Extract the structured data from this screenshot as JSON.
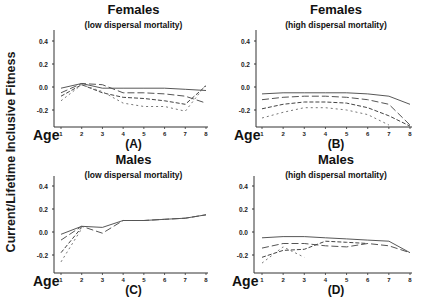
{
  "figure": {
    "ylabel": "Current/Lifetime Inclusive Fitness",
    "xlabel": "Age"
  },
  "chart_data": [
    {
      "type": "line",
      "panel": "(A)",
      "title": "Females",
      "subtitle": "(low dispersal mortality)",
      "xlabel": "Age",
      "ylabel": "Current/Lifetime Inclusive Fitness",
      "x": [
        1,
        2,
        3,
        4,
        5,
        6,
        7,
        8
      ],
      "yticks": [
        "0.4",
        "0.2",
        "0.0",
        "-0.2"
      ],
      "ylim": [
        -0.32,
        0.5
      ],
      "series": [
        {
          "name": "solid",
          "dash": "",
          "values": [
            -0.01,
            0.03,
            -0.01,
            -0.01,
            -0.01,
            -0.01,
            -0.02,
            -0.03
          ]
        },
        {
          "name": "long-dash",
          "dash": "7,3",
          "values": [
            -0.05,
            0.03,
            0.02,
            -0.05,
            -0.05,
            -0.06,
            -0.08,
            -0.14
          ]
        },
        {
          "name": "medium-dash",
          "dash": "4,2",
          "values": [
            -0.08,
            0.02,
            -0.05,
            -0.09,
            -0.1,
            -0.12,
            -0.15,
            0.01
          ]
        },
        {
          "name": "short-dash",
          "dash": "2,3",
          "values": [
            -0.12,
            0.02,
            -0.04,
            -0.14,
            -0.17,
            -0.17,
            -0.21,
            0.02
          ]
        }
      ]
    },
    {
      "type": "line",
      "panel": "(B)",
      "title": "Females",
      "subtitle": "(high dispersal mortality)",
      "xlabel": "Age",
      "ylabel": "Current/Lifetime Inclusive Fitness",
      "x": [
        1,
        2,
        3,
        4,
        5,
        6,
        7,
        8
      ],
      "yticks": [
        "0.4",
        "0.2",
        "0.0",
        "-0.2"
      ],
      "ylim": [
        -0.32,
        0.5
      ],
      "series": [
        {
          "name": "solid",
          "dash": "",
          "values": [
            -0.06,
            -0.05,
            -0.05,
            -0.05,
            -0.05,
            -0.06,
            -0.08,
            -0.15
          ]
        },
        {
          "name": "long-dash",
          "dash": "7,3",
          "values": [
            -0.11,
            -0.09,
            -0.08,
            -0.08,
            -0.09,
            -0.11,
            -0.15,
            -0.33
          ]
        },
        {
          "name": "medium-dash",
          "dash": "4,2",
          "values": [
            -0.19,
            -0.15,
            -0.13,
            -0.13,
            -0.14,
            -0.18,
            -0.25,
            -0.34
          ]
        },
        {
          "name": "short-dash",
          "dash": "2,3",
          "values": [
            -0.27,
            -0.22,
            -0.18,
            -0.18,
            -0.2,
            -0.24,
            -0.33,
            null
          ]
        }
      ]
    },
    {
      "type": "line",
      "panel": "(C)",
      "title": "Males",
      "subtitle": "(low dispersal mortality)",
      "xlabel": "Age",
      "ylabel": "Current/Lifetime Inclusive Fitness",
      "x": [
        1,
        2,
        3,
        4,
        5,
        6,
        7,
        8
      ],
      "yticks": [
        "0.4",
        "0.2",
        "0.0",
        "-0.2"
      ],
      "ylim": [
        -0.32,
        0.5
      ],
      "series": [
        {
          "name": "solid",
          "dash": "",
          "values": [
            -0.02,
            0.05,
            0.04,
            0.1,
            0.1,
            0.11,
            0.12,
            0.15
          ]
        },
        {
          "name": "long-dash",
          "dash": "7,3",
          "values": [
            -0.07,
            0.05,
            -0.01,
            0.1,
            0.1,
            0.11,
            0.12,
            0.15
          ]
        },
        {
          "name": "medium-dash",
          "dash": "4,2",
          "values": [
            -0.18,
            0.04,
            null,
            null,
            null,
            null,
            null,
            null
          ]
        },
        {
          "name": "short-dash",
          "dash": "2,3",
          "values": [
            -0.26,
            0.03,
            null,
            null,
            null,
            null,
            null,
            null
          ]
        }
      ]
    },
    {
      "type": "line",
      "panel": "(D)",
      "title": "Males",
      "subtitle": "(high dispersal mortality)",
      "xlabel": "Age",
      "ylabel": "Current/Lifetime Inclusive Fitness",
      "x": [
        1,
        2,
        3,
        4,
        5,
        6,
        7,
        8
      ],
      "yticks": [
        "0.4",
        "0.2",
        "0.0",
        "-0.2"
      ],
      "ylim": [
        -0.32,
        0.5
      ],
      "series": [
        {
          "name": "solid",
          "dash": "",
          "values": [
            -0.05,
            -0.04,
            -0.04,
            -0.05,
            -0.06,
            -0.07,
            -0.08,
            -0.18
          ]
        },
        {
          "name": "long-dash",
          "dash": "7,3",
          "values": [
            -0.14,
            -0.1,
            -0.1,
            -0.12,
            -0.13,
            -0.1,
            -0.12,
            -0.18
          ]
        },
        {
          "name": "medium-dash",
          "dash": "4,2",
          "values": [
            -0.22,
            -0.16,
            -0.15,
            -0.08,
            -0.09,
            -0.1,
            null,
            null
          ]
        },
        {
          "name": "short-dash",
          "dash": "2,3",
          "values": [
            -0.27,
            -0.13,
            -0.22,
            null,
            null,
            null,
            null,
            null
          ]
        }
      ]
    }
  ]
}
